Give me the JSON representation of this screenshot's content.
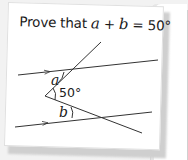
{
  "card": {
    "title_prefix": "Prove that ",
    "var_a": "a",
    "plus": " + ",
    "var_b": "b",
    "equals": " = 50°"
  },
  "diagram": {
    "label_a": "a",
    "label_angle": "50°",
    "label_b": "b",
    "line_color": "#333333"
  }
}
